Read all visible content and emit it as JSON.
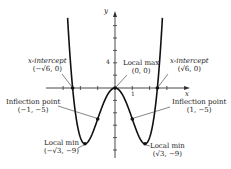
{
  "figure": {
    "type": "function-graph",
    "colors": {
      "curve": "#111111",
      "axis": "#333333",
      "text": "#222222",
      "background": "#ffffff"
    },
    "axes": {
      "x_label": "x",
      "y_label": "y",
      "x_tick_label": "1",
      "y_tick_label": "4"
    },
    "annotations": {
      "x_intercept_left": {
        "title": "x-intercept",
        "coords": "(−√6, 0)"
      },
      "x_intercept_right": {
        "title": "x-intercept",
        "coords": "(√6, 0)"
      },
      "local_max": {
        "title": "Local max",
        "coords": "(0, 0)"
      },
      "inflection_left": {
        "title": "Inflection point",
        "coords": "(−1, −5)"
      },
      "inflection_right": {
        "title": "Inflection point",
        "coords": "(1, −5)"
      },
      "local_min_left": {
        "title": "Local min",
        "coords": "(−√3, −9)"
      },
      "local_min_right": {
        "title": "Local min",
        "coords": "(√3, −9)"
      }
    }
  },
  "chart_data": {
    "type": "line",
    "title": "",
    "function": "y = x^4 - 6x^2",
    "xlabel": "x",
    "ylabel": "y",
    "xlim": [
      -3.0,
      4.2
    ],
    "ylim": [
      -11,
      12
    ],
    "grid": false,
    "x_ticks": [
      -3,
      -2,
      -1,
      1,
      2,
      3
    ],
    "y_ticks": [
      -10,
      -8,
      -6,
      -4,
      -2,
      2,
      4,
      6,
      8
    ],
    "key_points": [
      {
        "label": "x-intercept",
        "x": -2.449,
        "y": 0
      },
      {
        "label": "Inflection point",
        "x": -1,
        "y": -5
      },
      {
        "label": "Local min",
        "x": -1.732,
        "y": -9
      },
      {
        "label": "Local max",
        "x": 0,
        "y": 0
      },
      {
        "label": "Inflection point",
        "x": 1,
        "y": -5
      },
      {
        "label": "Local min",
        "x": 1.732,
        "y": -9
      },
      {
        "label": "x-intercept",
        "x": 2.449,
        "y": 0
      }
    ]
  }
}
